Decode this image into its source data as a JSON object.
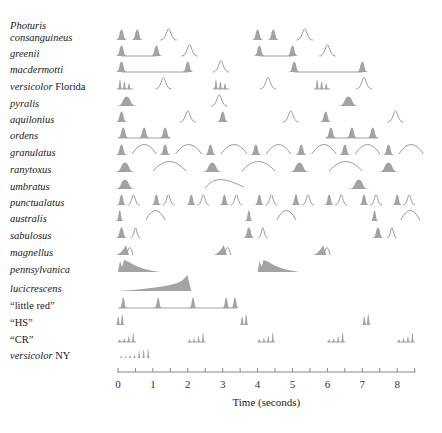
{
  "chart_data": {
    "type": "timeline",
    "title": "",
    "xlabel": "Time (seconds)",
    "xlim": [
      0,
      8.5
    ],
    "xticks": [
      0,
      1,
      2,
      3,
      4,
      5,
      6,
      7,
      8
    ],
    "minor_tick_step": 0.5,
    "colors": {
      "pulse_fill": "#a3a3a3",
      "pulse_outline": "#9a9a9a",
      "axis": "#888888"
    },
    "rows": [
      {
        "label_parts": [
          {
            "text": "Photuris",
            "italic": true
          }
        ],
        "label2_parts": [
          {
            "text": "consanguineus",
            "italic": true
          }
        ],
        "marks": [
          {
            "kind": "filled",
            "t": 0.1
          },
          {
            "kind": "filled",
            "t": 0.55
          },
          {
            "kind": "outline",
            "t": 1.45
          },
          {
            "kind": "filled",
            "t": 4.0
          },
          {
            "kind": "filled",
            "t": 4.45
          },
          {
            "kind": "outline",
            "t": 5.35
          }
        ]
      },
      {
        "label_parts": [
          {
            "text": "greenii",
            "italic": true
          }
        ],
        "marks": [
          {
            "kind": "filled",
            "t": 0.1
          },
          {
            "kind": "line",
            "t": 0.1,
            "t2": 1.1
          },
          {
            "kind": "filled",
            "t": 1.1
          },
          {
            "kind": "outline",
            "t": 2.05
          },
          {
            "kind": "filled",
            "t": 4.05
          },
          {
            "kind": "line",
            "t": 4.05,
            "t2": 5.0
          },
          {
            "kind": "filled",
            "t": 5.0
          },
          {
            "kind": "outline",
            "t": 6.0
          }
        ]
      },
      {
        "label_parts": [
          {
            "text": "macdermotti",
            "italic": true
          }
        ],
        "marks": [
          {
            "kind": "filled",
            "t": 0.1
          },
          {
            "kind": "line",
            "t": 0.1,
            "t2": 2.0
          },
          {
            "kind": "filled",
            "t": 2.0
          },
          {
            "kind": "outline",
            "t": 2.95
          },
          {
            "kind": "filled",
            "t": 5.05
          },
          {
            "kind": "line",
            "t": 5.05,
            "t2": 7.0
          },
          {
            "kind": "filled",
            "t": 7.0
          }
        ]
      },
      {
        "label_parts": [
          {
            "text": "versicolor",
            "italic": true
          },
          {
            "text": " Florida",
            "italic": false
          }
        ],
        "marks": [
          {
            "kind": "triple",
            "t": 0.2
          },
          {
            "kind": "outline",
            "t": 1.3
          },
          {
            "kind": "triple",
            "t": 2.95
          },
          {
            "kind": "outline",
            "t": 4.3
          },
          {
            "kind": "triple",
            "t": 5.85
          },
          {
            "kind": "outline",
            "t": 7.05
          }
        ]
      },
      {
        "label_parts": [
          {
            "text": "pyralis",
            "italic": true
          }
        ],
        "marks": [
          {
            "kind": "wide",
            "t": 0.25
          },
          {
            "kind": "outline",
            "t": 2.9
          },
          {
            "kind": "wide",
            "t": 6.6
          }
        ]
      },
      {
        "label_parts": [
          {
            "text": "aquilonius",
            "italic": true
          }
        ],
        "marks": [
          {
            "kind": "filled",
            "t": 0.1
          },
          {
            "kind": "outline",
            "t": 2.0
          },
          {
            "kind": "filled",
            "t": 3.0
          },
          {
            "kind": "outline",
            "t": 4.95
          },
          {
            "kind": "filled",
            "t": 5.95
          },
          {
            "kind": "outline",
            "t": 7.95
          }
        ]
      },
      {
        "label_parts": [
          {
            "text": "ordens",
            "italic": true
          }
        ],
        "marks": [
          {
            "kind": "line",
            "t": 0.0,
            "t2": 1.5
          },
          {
            "kind": "filled",
            "t": 0.15
          },
          {
            "kind": "filled",
            "t": 0.75
          },
          {
            "kind": "filled",
            "t": 1.35
          },
          {
            "kind": "line",
            "t": 5.95,
            "t2": 7.45
          },
          {
            "kind": "filled",
            "t": 6.1
          },
          {
            "kind": "filled",
            "t": 6.7
          },
          {
            "kind": "filled",
            "t": 7.3
          }
        ]
      },
      {
        "label_parts": [
          {
            "text": "granulatus",
            "italic": true
          }
        ],
        "marks": [
          {
            "kind": "filled",
            "t": 0.1
          },
          {
            "kind": "arc",
            "t": 0.4,
            "t2": 1.1
          },
          {
            "kind": "filled",
            "t": 1.35
          },
          {
            "kind": "arc",
            "t": 1.65,
            "t2": 2.4
          },
          {
            "kind": "filled",
            "t": 2.65
          },
          {
            "kind": "arc",
            "t": 2.95,
            "t2": 3.7
          },
          {
            "kind": "filled",
            "t": 3.95
          },
          {
            "kind": "arc",
            "t": 4.25,
            "t2": 4.95
          },
          {
            "kind": "filled",
            "t": 5.25
          },
          {
            "kind": "arc",
            "t": 5.55,
            "t2": 6.25
          },
          {
            "kind": "filled",
            "t": 6.5
          },
          {
            "kind": "arc",
            "t": 6.8,
            "t2": 7.5
          },
          {
            "kind": "filled",
            "t": 7.75
          },
          {
            "kind": "arc",
            "t": 8.05,
            "t2": 8.75
          }
        ]
      },
      {
        "label_parts": [
          {
            "text": "ranytoxus",
            "italic": true
          }
        ],
        "marks": [
          {
            "kind": "wide",
            "t": 0.2
          },
          {
            "kind": "arc",
            "t": 1.0,
            "t2": 1.95
          },
          {
            "kind": "wide",
            "t": 2.7
          },
          {
            "kind": "arc",
            "t": 3.55,
            "t2": 4.5
          },
          {
            "kind": "wide",
            "t": 5.2
          },
          {
            "kind": "arc",
            "t": 6.05,
            "t2": 7.0
          },
          {
            "kind": "wide",
            "t": 7.75
          }
        ]
      },
      {
        "label_parts": [
          {
            "text": "umbratus",
            "italic": true
          }
        ],
        "marks": [
          {
            "kind": "wide",
            "t": 0.2
          },
          {
            "kind": "wave",
            "t": 2.5,
            "t2": 3.6
          },
          {
            "kind": "wide",
            "t": 6.9
          }
        ]
      },
      {
        "label_parts": [
          {
            "text": "punctualatus",
            "italic": true
          }
        ],
        "marks": [
          {
            "kind": "pair",
            "t": 0.1
          },
          {
            "kind": "pair",
            "t": 1.1
          },
          {
            "kind": "pair",
            "t": 2.1
          },
          {
            "kind": "pair",
            "t": 3.05
          },
          {
            "kind": "pair",
            "t": 4.05
          },
          {
            "kind": "pair",
            "t": 5.1
          },
          {
            "kind": "pair",
            "t": 6.05
          },
          {
            "kind": "pair",
            "t": 7.05
          },
          {
            "kind": "pair",
            "t": 8.0
          }
        ]
      },
      {
        "label_parts": [
          {
            "text": "australis",
            "italic": true
          }
        ],
        "marks": [
          {
            "kind": "narrow",
            "t": 0.05
          },
          {
            "kind": "arc",
            "t": 0.8,
            "t2": 1.35
          },
          {
            "kind": "narrow",
            "t": 3.75
          },
          {
            "kind": "arc",
            "t": 4.55,
            "t2": 5.1
          },
          {
            "kind": "narrow",
            "t": 7.35
          },
          {
            "kind": "arc",
            "t": 8.1,
            "t2": 8.65
          }
        ]
      },
      {
        "label_parts": [
          {
            "text": "sabulosus",
            "italic": true
          }
        ],
        "marks": [
          {
            "kind": "filled",
            "t": 0.1
          },
          {
            "kind": "small-outline",
            "t": 0.5
          },
          {
            "kind": "filled",
            "t": 3.75
          },
          {
            "kind": "small-outline",
            "t": 4.15
          },
          {
            "kind": "filled",
            "t": 7.45
          },
          {
            "kind": "small-outline",
            "t": 7.85
          }
        ]
      },
      {
        "label_parts": [
          {
            "text": "magnellus",
            "italic": true
          }
        ],
        "marks": [
          {
            "kind": "glow",
            "t": 0.2
          },
          {
            "kind": "glow",
            "t": 3.0
          },
          {
            "kind": "glow",
            "t": 5.85
          }
        ]
      },
      {
        "label_parts": [
          {
            "text": "pennsylvanica",
            "italic": true
          }
        ],
        "marks": [
          {
            "kind": "decay",
            "t": 0.0,
            "t2": 1.2
          },
          {
            "kind": "decay",
            "t": 4.0,
            "t2": 5.2
          }
        ]
      },
      {
        "label_parts": [
          {
            "text": "lucicrescens",
            "italic": true
          }
        ],
        "marks": [
          {
            "kind": "ramp",
            "t": 0.0,
            "t2": 2.1
          }
        ]
      },
      {
        "label_parts": [
          {
            "text": "“little red”",
            "italic": false
          }
        ],
        "marks": [
          {
            "kind": "line",
            "t": 0.0,
            "t2": 3.4
          },
          {
            "kind": "narrow",
            "t": 0.15
          },
          {
            "kind": "narrow",
            "t": 1.15
          },
          {
            "kind": "narrow",
            "t": 2.15
          },
          {
            "kind": "narrow",
            "t": 3.1
          },
          {
            "kind": "narrow",
            "t": 3.35
          }
        ]
      },
      {
        "label_parts": [
          {
            "text": "“HS”",
            "italic": false
          }
        ],
        "marks": [
          {
            "kind": "double-spike",
            "t": 0.05
          },
          {
            "kind": "double-spike",
            "t": 3.6
          },
          {
            "kind": "double-spike",
            "t": 7.1
          }
        ]
      },
      {
        "label_parts": [
          {
            "text": "“CR”",
            "italic": false
          }
        ],
        "marks": [
          {
            "kind": "burst",
            "t": 0.05
          },
          {
            "kind": "burst",
            "t": 2.05
          },
          {
            "kind": "burst",
            "t": 4.05
          },
          {
            "kind": "burst",
            "t": 6.05
          },
          {
            "kind": "burst",
            "t": 8.05
          }
        ]
      },
      {
        "label_parts": [
          {
            "text": "versicolor",
            "italic": true
          },
          {
            "text": " NY",
            "italic": false
          }
        ],
        "marks": [
          {
            "kind": "train",
            "t": 0.0,
            "t2": 0.95
          }
        ]
      }
    ]
  }
}
